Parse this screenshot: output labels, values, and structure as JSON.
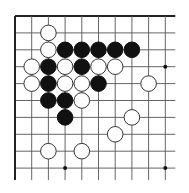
{
  "diagram": {
    "type": "go-board-fragment",
    "grid": {
      "origin_x": 15,
      "origin_y": 16,
      "spacing_x": 16.7,
      "spacing_y": 16.9,
      "cols": 10,
      "rows": 10,
      "extend_right": 10,
      "extend_bottom": 12,
      "edges": [
        "top",
        "left"
      ],
      "line_color": "#555555",
      "edge_color": "#222222"
    },
    "star_points": [
      {
        "col": 9,
        "row": 3
      },
      {
        "col": 3,
        "row": 9
      },
      {
        "col": 9,
        "row": 9
      }
    ],
    "stones": [
      {
        "color": "white",
        "col": 2,
        "row": 1
      },
      {
        "color": "white",
        "col": 2,
        "row": 2
      },
      {
        "color": "black",
        "col": 3,
        "row": 2
      },
      {
        "color": "black",
        "col": 4,
        "row": 2
      },
      {
        "color": "black",
        "col": 5,
        "row": 2
      },
      {
        "color": "black",
        "col": 6,
        "row": 2
      },
      {
        "color": "black",
        "col": 7,
        "row": 2
      },
      {
        "color": "white",
        "col": 1,
        "row": 3
      },
      {
        "color": "black",
        "col": 2,
        "row": 3
      },
      {
        "color": "white",
        "col": 3,
        "row": 3
      },
      {
        "color": "black",
        "col": 4,
        "row": 3
      },
      {
        "color": "white",
        "col": 5,
        "row": 3
      },
      {
        "color": "white",
        "col": 6,
        "row": 3
      },
      {
        "color": "white",
        "col": 1,
        "row": 4
      },
      {
        "color": "black",
        "col": 2,
        "row": 4
      },
      {
        "color": "white",
        "col": 3,
        "row": 4
      },
      {
        "color": "white",
        "col": 4,
        "row": 4
      },
      {
        "color": "black",
        "col": 5,
        "row": 4
      },
      {
        "color": "white",
        "col": 8,
        "row": 4
      },
      {
        "color": "black",
        "col": 2,
        "row": 5
      },
      {
        "color": "black",
        "col": 3,
        "row": 5
      },
      {
        "color": "white",
        "col": 4,
        "row": 5
      },
      {
        "color": "black",
        "col": 3,
        "row": 6
      },
      {
        "color": "white",
        "col": 7,
        "row": 6
      },
      {
        "color": "white",
        "col": 6,
        "row": 7
      },
      {
        "color": "white",
        "col": 2,
        "row": 8
      },
      {
        "color": "white",
        "col": 4,
        "row": 8
      }
    ]
  }
}
